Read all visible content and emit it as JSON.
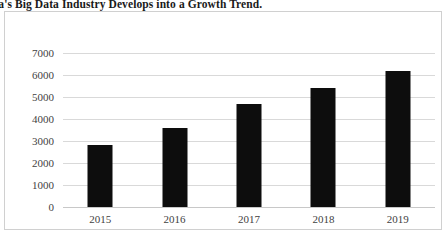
{
  "caption": {
    "text": "hina's Big Data Industry Develops into a Growth Trend."
  },
  "colors": {
    "bar": "#0d0d0d",
    "gridline": "#d9d9d9",
    "axis_text": "#3f3f3f",
    "frame_border": "#d0d0d0",
    "background": "#ffffff"
  },
  "chart_data": {
    "type": "bar",
    "title": "",
    "xlabel": "",
    "ylabel": "",
    "categories": [
      "2015",
      "2016",
      "2017",
      "2018",
      "2019"
    ],
    "values": [
      2800,
      3580,
      4680,
      5400,
      6200
    ],
    "series": [
      {
        "name": "Market size",
        "values": [
          2800,
          3580,
          4680,
          5400,
          6200
        ]
      }
    ],
    "ylim": [
      0,
      7000
    ],
    "yticks": [
      0,
      1000,
      2000,
      3000,
      4000,
      5000,
      6000,
      7000
    ],
    "ytick_labels": [
      "0",
      "1000",
      "2000",
      "3000",
      "4000",
      "5000",
      "6000",
      "7000"
    ],
    "grid": true,
    "legend": false,
    "legend_position": "none"
  }
}
